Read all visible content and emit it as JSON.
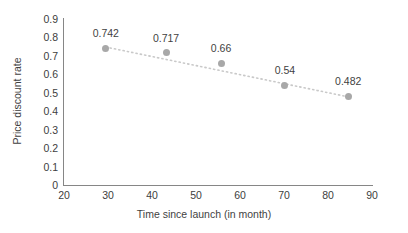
{
  "chart_data": {
    "type": "scatter",
    "title": "",
    "xlabel": "Time since launch (in month)",
    "ylabel": "Price discount rate",
    "xlim": [
      20,
      90
    ],
    "ylim": [
      0,
      0.9
    ],
    "grid": false,
    "legend": "none",
    "x": [
      29.5,
      43.2,
      55.7,
      70.2,
      84.6
    ],
    "values": [
      0.742,
      0.717,
      0.66,
      0.54,
      0.482
    ],
    "point_labels": [
      "0.742",
      "0.717",
      "0.66",
      "0.54",
      "0.482"
    ],
    "xticks": [
      20,
      30,
      40,
      50,
      60,
      70,
      80,
      90
    ],
    "xtick_labels": [
      "20",
      "30",
      "40",
      "50",
      "60",
      "70",
      "80",
      "90"
    ],
    "yticks": [
      0,
      0.1,
      0.2,
      0.3,
      0.4,
      0.5,
      0.6,
      0.7,
      0.8,
      0.9
    ],
    "ytick_labels": [
      "0",
      "0.1",
      "0.2",
      "0.3",
      "0.4",
      "0.5",
      "0.6",
      "0.7",
      "0.8",
      "0.9"
    ],
    "trendline": {
      "style": "dotted",
      "color": "#c9c9c9",
      "x_start": 29.5,
      "x_end": 84.6,
      "y_start": 0.748,
      "y_end": 0.478
    },
    "marker_color": "#a8a8a8",
    "axis_color": "#868686",
    "text_color": "#3f3f3f"
  }
}
